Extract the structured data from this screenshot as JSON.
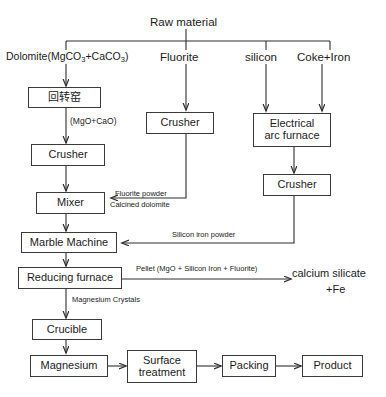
{
  "nodes": {
    "raw_material": "Raw material",
    "dolomite": "Dolomite(MgCO",
    "dolomite_full": "Dolomite(MgCO3+CaCO3)",
    "fluorite": "Fluorite",
    "silicon": "silicon",
    "coke_iron": "Coke+Iron",
    "rotary_kiln": "回转窑",
    "crusher_dolomite": "Crusher",
    "crusher_fluorite": "Crusher",
    "electrical_arc_furnace": "Electrical\narc furnace",
    "crusher_silicon": "Crusher",
    "mixer": "Mixer",
    "marble_machine": "Marble Machine",
    "reducing_furnace": "Reducing furnace",
    "crucible": "Crucible",
    "magnesium": "Magnesium",
    "surface_treatment": "Surface\ntreatment",
    "packing": "Packing",
    "product": "Product",
    "calcium_silicate": "calcium silicate",
    "calcium_silicate_fe": "+Fe"
  },
  "edge_labels": {
    "mgo_cao": "(MgO+CaO)",
    "fluorite_powder": "Fluorite powder",
    "calcined_dolomite": "Calcined dolomite",
    "silicon_iron_powder": "Silicon iron powder",
    "pellet": "Pellet (MgO + Silicon Iron + Fluorite)",
    "magnesium_crystals": "Magnesium Crystals"
  },
  "colors": {
    "line": "#2e2e2e",
    "box_border": "#3a3a3a",
    "text": "#1a1a1a",
    "background": "#ffffff"
  }
}
